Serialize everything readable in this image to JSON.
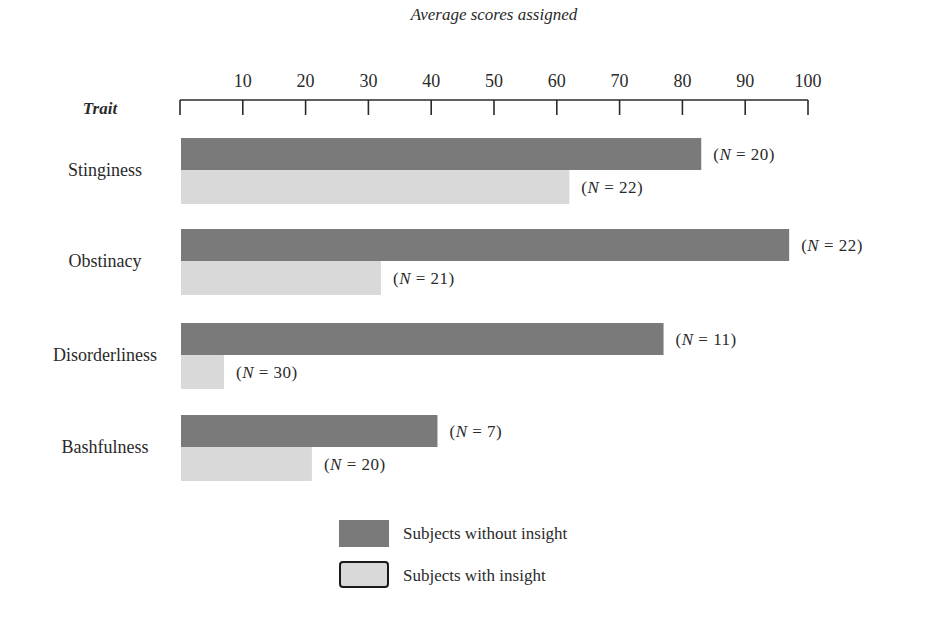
{
  "chart_data": {
    "type": "bar",
    "orientation": "horizontal",
    "title": "",
    "xlabel": "Average scores assigned",
    "ylabel": "Trait",
    "xlim": [
      0,
      100
    ],
    "xticks": [
      10,
      20,
      30,
      40,
      50,
      60,
      70,
      80,
      90,
      100
    ],
    "grid": false,
    "categories": [
      "Stinginess",
      "Obstinacy",
      "Disorderliness",
      "Bashfulness"
    ],
    "series": [
      {
        "name": "Subjects without insight",
        "color": "#7a7a7a",
        "values": [
          83,
          97,
          77,
          41
        ],
        "n_labels": [
          "(N = 20)",
          "(N = 22)",
          "(N = 11)",
          "(N = 7)"
        ]
      },
      {
        "name": "Subjects with insight",
        "color": "#d9d9d9",
        "values": [
          62,
          32,
          7,
          21
        ],
        "n_labels": [
          "(N = 22)",
          "(N = 21)",
          "(N = 30)",
          "(N = 20)"
        ]
      }
    ],
    "legend": {
      "position": "bottom-center",
      "entries": [
        "Subjects without insight",
        "Subjects with insight"
      ]
    }
  }
}
